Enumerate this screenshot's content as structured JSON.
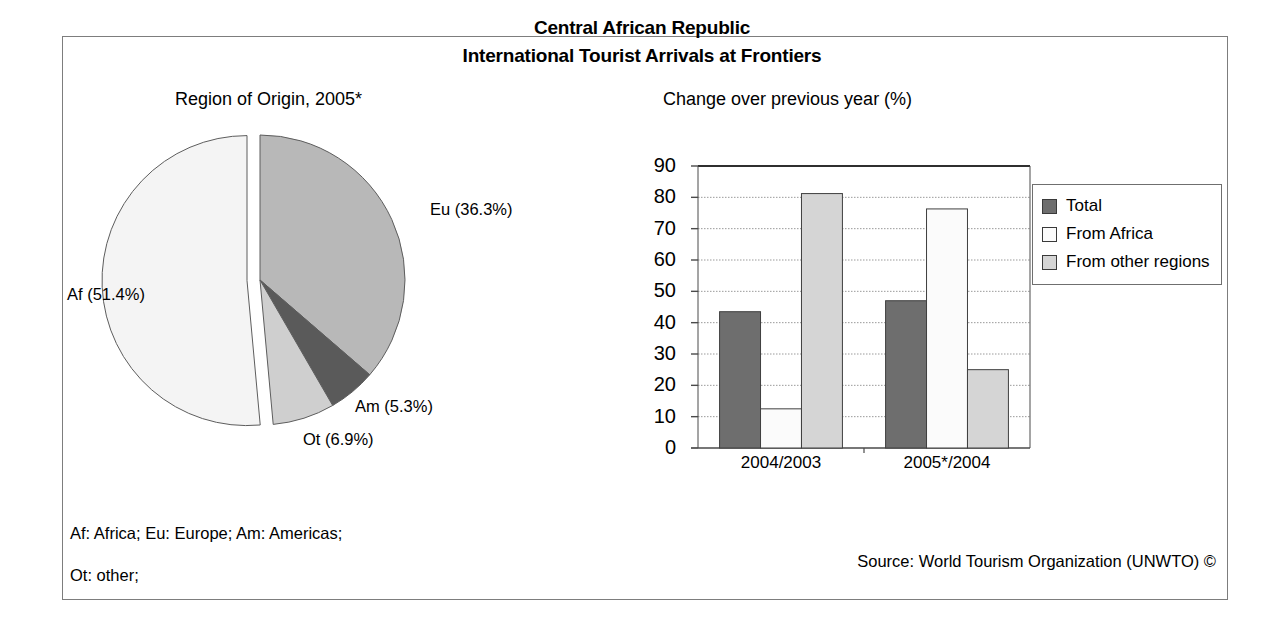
{
  "frame": {
    "title_line_1": "Central African Republic",
    "title_line_2": "International Tourist Arrivals at Frontiers"
  },
  "pie_subtitle": "Region of Origin, 2005*",
  "bar_subtitle": "Change over previous year (%)",
  "footnotes": {
    "abbrev_line_1": "Af: Africa; Eu: Europe; Am: Americas;",
    "abbrev_line_2": "Ot: other;",
    "source": "Source: World Tourism Organization (UNWTO) ©"
  },
  "pie_labels": {
    "eu": "Eu (36.3%)",
    "af": "Af (51.4%)",
    "am": "Am (5.3%)",
    "ot": "Ot (6.9%)"
  },
  "legend": {
    "items": [
      {
        "label": "Total",
        "color": "#6e6e6e"
      },
      {
        "label": "From Africa",
        "color": "#fbfbfb"
      },
      {
        "label": "From other regions",
        "color": "#d5d5d5"
      }
    ]
  },
  "colors": {
    "pie_eu": "#b8b8b8",
    "pie_am": "#5a5a5a",
    "pie_ot": "#cfcfcf",
    "pie_af": "#f4f4f4",
    "bar_total": "#6e6e6e",
    "bar_africa": "#fbfbfb",
    "bar_other": "#d5d5d5",
    "axis": "#4a4a4a",
    "gridline": "#9a9a9a",
    "frame_border": "#7d7d7d"
  },
  "chart_data": [
    {
      "type": "pie",
      "title": "Region of Origin, 2005*",
      "categories": [
        "Eu",
        "Am",
        "Ot",
        "Af"
      ],
      "labels": [
        "Eu (36.3%)",
        "Am (5.3%)",
        "Ot (6.9%)",
        "Af (51.4%)"
      ],
      "values": [
        36.3,
        5.3,
        6.9,
        51.4
      ],
      "unit": "%",
      "exploded_slices": [
        "Af"
      ],
      "start_angle_deg": 0,
      "direction": "clockwise",
      "legend": "none"
    },
    {
      "type": "bar",
      "title": "Change over previous year (%)",
      "categories": [
        "2004/2003",
        "2005*/2004"
      ],
      "series": [
        {
          "name": "Total",
          "values": [
            43.5,
            47.0
          ]
        },
        {
          "name": "From Africa",
          "values": [
            12.5,
            76.3
          ]
        },
        {
          "name": "From other regions",
          "values": [
            81.2,
            25.0
          ]
        }
      ],
      "xlabel": "",
      "ylabel": "",
      "ylim": [
        0,
        90
      ],
      "yticks": [
        0,
        10,
        20,
        30,
        40,
        50,
        60,
        70,
        80,
        90
      ],
      "ytick_labels": [
        "0",
        "10",
        "20",
        "30",
        "40",
        "50",
        "60",
        "70",
        "80",
        "90"
      ],
      "grid": true,
      "grid_axis": "y",
      "legend_position": "right"
    }
  ]
}
